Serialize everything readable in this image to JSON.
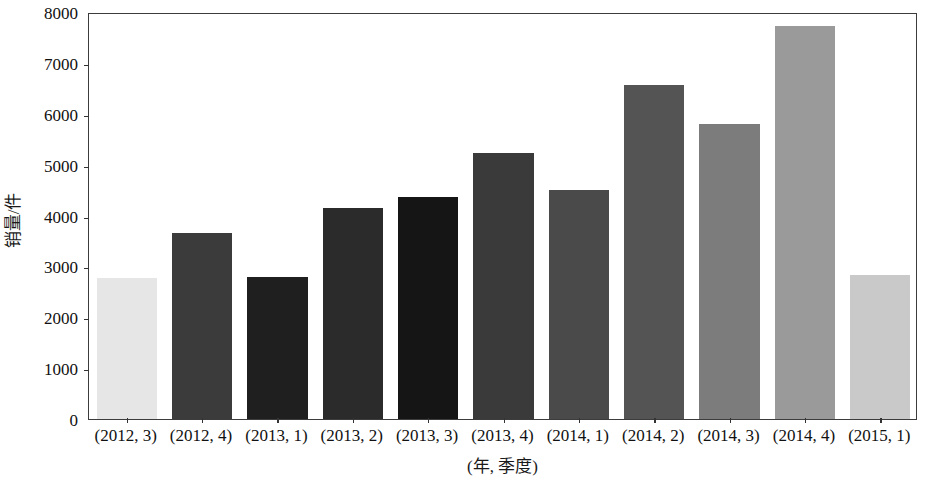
{
  "chart_data": {
    "type": "bar",
    "title": "",
    "subtitle": "",
    "xlabel": "(年, 季度)",
    "ylabel": "销量/件",
    "categories": [
      "(2012, 3)",
      "(2012, 4)",
      "(2013, 1)",
      "(2013, 2)",
      "(2013, 3)",
      "(2013, 4)",
      "(2014, 1)",
      "(2014, 2)",
      "(2014, 3)",
      "(2014, 4)",
      "(2015, 1)"
    ],
    "values": [
      2780,
      3660,
      2790,
      4140,
      4360,
      5230,
      4510,
      6560,
      5790,
      7720,
      2830
    ],
    "bar_colors": [
      "#e6e6e6",
      "#3b3b3b",
      "#1f1f1f",
      "#2b2b2b",
      "#151515",
      "#3a3a3a",
      "#4a4a4a",
      "#545454",
      "#7c7c7c",
      "#9a9a9a",
      "#c9c9c9"
    ],
    "ylim": [
      0,
      8000
    ],
    "yticks": [
      0,
      1000,
      2000,
      3000,
      4000,
      5000,
      6000,
      7000,
      8000
    ],
    "ytick_labels": [
      "0",
      "1000",
      "2000",
      "3000",
      "4000",
      "5000",
      "6000",
      "7000",
      "8000"
    ],
    "grid": false,
    "legend": null,
    "legend_position": "none",
    "axis_color": "#3c3c3c",
    "background_color": "#ffffff"
  }
}
